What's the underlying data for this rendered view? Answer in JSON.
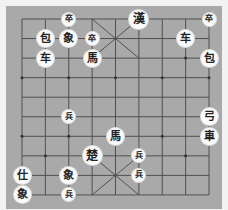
{
  "board": {
    "columns": 9,
    "rows": 10,
    "origin_x": 22,
    "origin_y": 19,
    "col_spacing": 23.375,
    "row_spacing": 19.55,
    "colors": {
      "background": "#a9a9a9",
      "line": "#505050",
      "frame": "#f2f2f2",
      "piece_fill": "#fafafa",
      "piece_text": "#222222"
    }
  },
  "pieces": [
    {
      "char": "卒",
      "row": 0,
      "col": 2,
      "size": "small",
      "name": "piece-black-soldier"
    },
    {
      "char": "漢",
      "row": 0,
      "col": 5,
      "size": "large",
      "name": "piece-black-general"
    },
    {
      "char": "卒",
      "row": 0,
      "col": 8,
      "size": "small",
      "name": "piece-black-soldier"
    },
    {
      "char": "包",
      "row": 1,
      "col": 1,
      "size": "normal",
      "name": "piece-black-cannon"
    },
    {
      "char": "象",
      "row": 1,
      "col": 2,
      "size": "normal",
      "name": "piece-black-elephant"
    },
    {
      "char": "卒",
      "row": 1,
      "col": 3,
      "size": "small",
      "name": "piece-black-soldier"
    },
    {
      "char": "车",
      "row": 1,
      "col": 7,
      "size": "normal",
      "name": "piece-black-chariot"
    },
    {
      "char": "车",
      "row": 2,
      "col": 1,
      "size": "normal",
      "name": "piece-black-chariot"
    },
    {
      "char": "馬",
      "row": 2,
      "col": 3,
      "size": "normal",
      "name": "piece-black-horse"
    },
    {
      "char": "包",
      "row": 2,
      "col": 8,
      "size": "normal",
      "name": "piece-black-cannon"
    },
    {
      "char": "兵",
      "row": 5,
      "col": 2,
      "size": "small",
      "name": "piece-red-soldier"
    },
    {
      "char": "弓",
      "row": 5,
      "col": 8,
      "size": "normal",
      "name": "piece-red-cannon"
    },
    {
      "char": "馬",
      "row": 6,
      "col": 4,
      "size": "normal",
      "name": "piece-red-horse"
    },
    {
      "char": "車",
      "row": 6,
      "col": 8,
      "size": "normal",
      "name": "piece-red-chariot"
    },
    {
      "char": "楚",
      "row": 7,
      "col": 3,
      "size": "large",
      "name": "piece-red-general"
    },
    {
      "char": "兵",
      "row": 7,
      "col": 5,
      "size": "small",
      "name": "piece-red-soldier"
    },
    {
      "char": "仕",
      "row": 8,
      "col": 0,
      "size": "normal",
      "name": "piece-red-advisor"
    },
    {
      "char": "象",
      "row": 8,
      "col": 2,
      "size": "normal",
      "name": "piece-red-elephant"
    },
    {
      "char": "兵",
      "row": 8,
      "col": 5,
      "size": "small",
      "name": "piece-red-soldier"
    },
    {
      "char": "象",
      "row": 9,
      "col": 0,
      "size": "normal",
      "name": "piece-red-elephant"
    },
    {
      "char": "兵",
      "row": 9,
      "col": 2,
      "size": "small",
      "name": "piece-red-soldier"
    }
  ]
}
